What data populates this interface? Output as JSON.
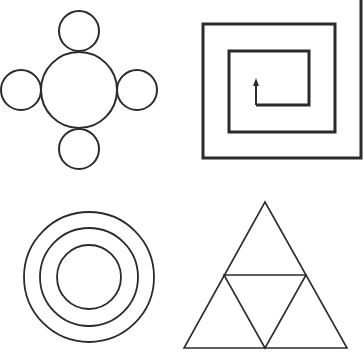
{
  "canvas": {
    "width": 364,
    "height": 359,
    "background": "#ffffff",
    "stroke_color": "#2b2b2b"
  },
  "figures": [
    {
      "id": "circle-cluster",
      "description": "Large central circle with four smaller circles touching it at top, bottom, left and right",
      "center_circle": {
        "cx": 79,
        "cy": 90,
        "r": 38
      },
      "satellites": [
        {
          "position": "top",
          "cx": 79,
          "cy": 31,
          "r": 20
        },
        {
          "position": "bottom",
          "cx": 79,
          "cy": 149,
          "r": 20
        },
        {
          "position": "left",
          "cx": 21,
          "cy": 90,
          "r": 20
        },
        {
          "position": "right",
          "cx": 137,
          "cy": 90,
          "r": 20
        }
      ],
      "stroke_width": 2
    },
    {
      "id": "square-spiral",
      "description": "Rectangular spiral starting at an inner upward arrow and winding outward, exiting at top right",
      "path": "M256,105 L309,105 L309,51 L229,51 L229,132 L335,132 L335,24 L203,24 L203,158 L361,158 L361,0",
      "arrow": {
        "x": 256,
        "y_start": 105,
        "y_tip": 78,
        "direction": "up"
      },
      "stroke_width": 3
    },
    {
      "id": "concentric-circles",
      "description": "Three concentric circles",
      "cx": 89,
      "cy": 277,
      "radii": [
        65,
        49,
        32
      ],
      "stroke_width": 1.8
    },
    {
      "id": "subdivided-triangle",
      "description": "Equilateral triangle divided into four smaller triangles by joining edge midpoints",
      "outer": [
        [
          265,
          202
        ],
        [
          184,
          348
        ],
        [
          347,
          348
        ]
      ],
      "inner": [
        [
          224,
          275
        ],
        [
          306,
          275
        ],
        [
          265,
          348
        ]
      ],
      "stroke_width": 1.6
    }
  ]
}
